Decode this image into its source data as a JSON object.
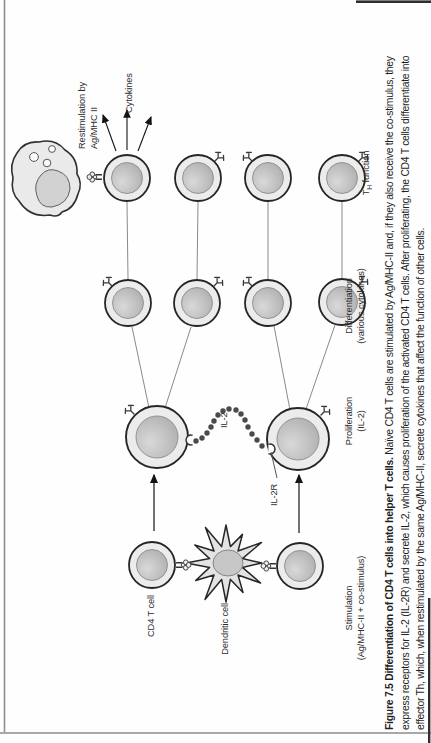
{
  "figure": {
    "caption": {
      "line1_bold": "Figure 7.5 Differentiation of CD4 T cells into helper T cells.",
      "line1_rest": " Naïve CD4 T cells are stimulated by Ag/MHC-II and, if they also receive the co-stimulus, they",
      "line2": "express receptors for IL-2 (IL-2R) and secrete IL-2, which causes proliferation of the activated CD4 T cells. After proliferating, the CD4 T cells differentiate into",
      "line3": "effector Th, which, when restimulated by the same Ag/MHC-II, secrete cytokines that affect the function of other cells."
    },
    "labels": {
      "cd4_t_cell": "CD4 T cell",
      "dendritic_cell": "Dendritic cell",
      "il2": "IL-2",
      "il2r": "IL-2R",
      "restimulation_line1": "Restimulation by",
      "restimulation_line2": "Ag/MHC II",
      "cytokines": "Cytokines",
      "th_prefix": "T",
      "th_subscript": "H",
      "th_suffix": " function"
    },
    "stages": [
      {
        "name": "Stimulation",
        "detail": "(Ag/MHC-II + co-stimulus)"
      },
      {
        "name": "Proliferation",
        "detail": "(IL-2)"
      },
      {
        "name": "Differentiation",
        "detail": "(various cytokines)"
      }
    ],
    "colors": {
      "cell_ring": "#ececec",
      "cell_outline": "#262626",
      "nucleus": "#bdbdbd",
      "beads": "#4a4a4a",
      "thin_line": "#8a8a8a",
      "arrow": "#141414"
    }
  }
}
